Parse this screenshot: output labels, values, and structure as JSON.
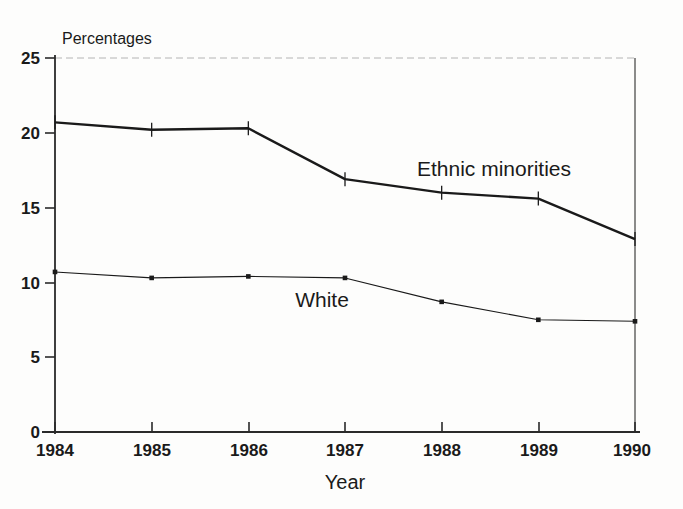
{
  "chart_data": {
    "type": "line",
    "title": "Percentages",
    "xlabel": "Year",
    "ylabel": "",
    "categories": [
      "1984",
      "1985",
      "1986",
      "1987",
      "1988",
      "1989",
      "1990"
    ],
    "x": [
      1984,
      1985,
      1986,
      1987,
      1988,
      1989,
      1990
    ],
    "xlim": [
      1984,
      1990
    ],
    "ylim": [
      0,
      25
    ],
    "yticks": [
      "0",
      "5",
      "10",
      "15",
      "20",
      "25"
    ],
    "ytick_values": [
      0,
      5,
      10,
      15,
      20,
      25
    ],
    "grid": false,
    "legend": "inline-annotations",
    "series": [
      {
        "name": "Ethnic minorities",
        "values": [
          20.7,
          20.2,
          20.3,
          16.9,
          16.0,
          15.6,
          12.9
        ],
        "marker": "plus",
        "line_width": 2.4,
        "color": "#1a1a1a",
        "label_x": 1987.55,
        "label_y": 18.6
      },
      {
        "name": "White",
        "values": [
          10.7,
          10.3,
          10.4,
          10.3,
          8.7,
          7.5,
          7.4
        ],
        "marker": "square",
        "line_width": 1.1,
        "color": "#1a1a1a",
        "label_x": 1986.8,
        "label_y": 9.0
      }
    ],
    "annotations": [
      {
        "text": "Ethnic minorities",
        "series": "Ethnic minorities"
      },
      {
        "text": "White",
        "series": "White"
      }
    ]
  },
  "colors": {
    "axis": "#2a2a2a",
    "text": "#1a1a1a",
    "background": "#fdfdfc",
    "frame_light": "#9a9a9a"
  }
}
